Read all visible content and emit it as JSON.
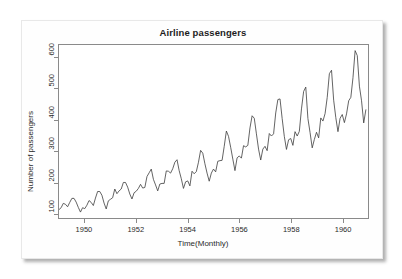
{
  "card": {
    "background_color": "#fefefe",
    "shadow_color": "#5a5a5a"
  },
  "chart_data": {
    "type": "line",
    "title": "Airline passengers",
    "xlabel": "Time(Monthly)",
    "ylabel": "Number of passengers",
    "xlim": [
      1949.0,
      1961.0
    ],
    "ylim": [
      85,
      640
    ],
    "grid": false,
    "legend": null,
    "line_color": "#3c3c3c",
    "line_width": 0.8,
    "x_ticks": [
      1950,
      1952,
      1954,
      1956,
      1958,
      1960
    ],
    "x_tick_labels": [
      "1950",
      "1952",
      "1954",
      "1956",
      "1958",
      "1960"
    ],
    "y_ticks": [
      100,
      200,
      300,
      400,
      500,
      600
    ],
    "y_tick_labels": [
      "100",
      "200",
      "300",
      "400",
      "500",
      "600"
    ],
    "x_start": 1949.0,
    "x_step": 0.0833333,
    "series": [
      {
        "name": "AirPassengers",
        "values": [
          112,
          118,
          132,
          129,
          121,
          135,
          148,
          148,
          136,
          119,
          104,
          118,
          115,
          126,
          141,
          135,
          125,
          149,
          170,
          170,
          158,
          133,
          114,
          140,
          145,
          150,
          178,
          163,
          172,
          178,
          199,
          199,
          184,
          162,
          146,
          166,
          171,
          180,
          193,
          181,
          183,
          218,
          230,
          242,
          209,
          191,
          172,
          194,
          196,
          196,
          236,
          235,
          229,
          243,
          264,
          272,
          237,
          211,
          180,
          201,
          204,
          188,
          235,
          227,
          234,
          264,
          302,
          293,
          259,
          229,
          203,
          229,
          242,
          233,
          267,
          269,
          270,
          315,
          364,
          347,
          312,
          274,
          237,
          278,
          284,
          277,
          317,
          313,
          318,
          374,
          413,
          405,
          355,
          306,
          271,
          306,
          315,
          301,
          356,
          348,
          355,
          422,
          465,
          467,
          404,
          347,
          305,
          336,
          340,
          318,
          362,
          348,
          363,
          435,
          491,
          505,
          404,
          359,
          310,
          337,
          360,
          342,
          406,
          396,
          420,
          472,
          548,
          559,
          463,
          407,
          362,
          405,
          417,
          391,
          419,
          461,
          472,
          535,
          622,
          606,
          508,
          461,
          390,
          432
        ]
      }
    ]
  }
}
